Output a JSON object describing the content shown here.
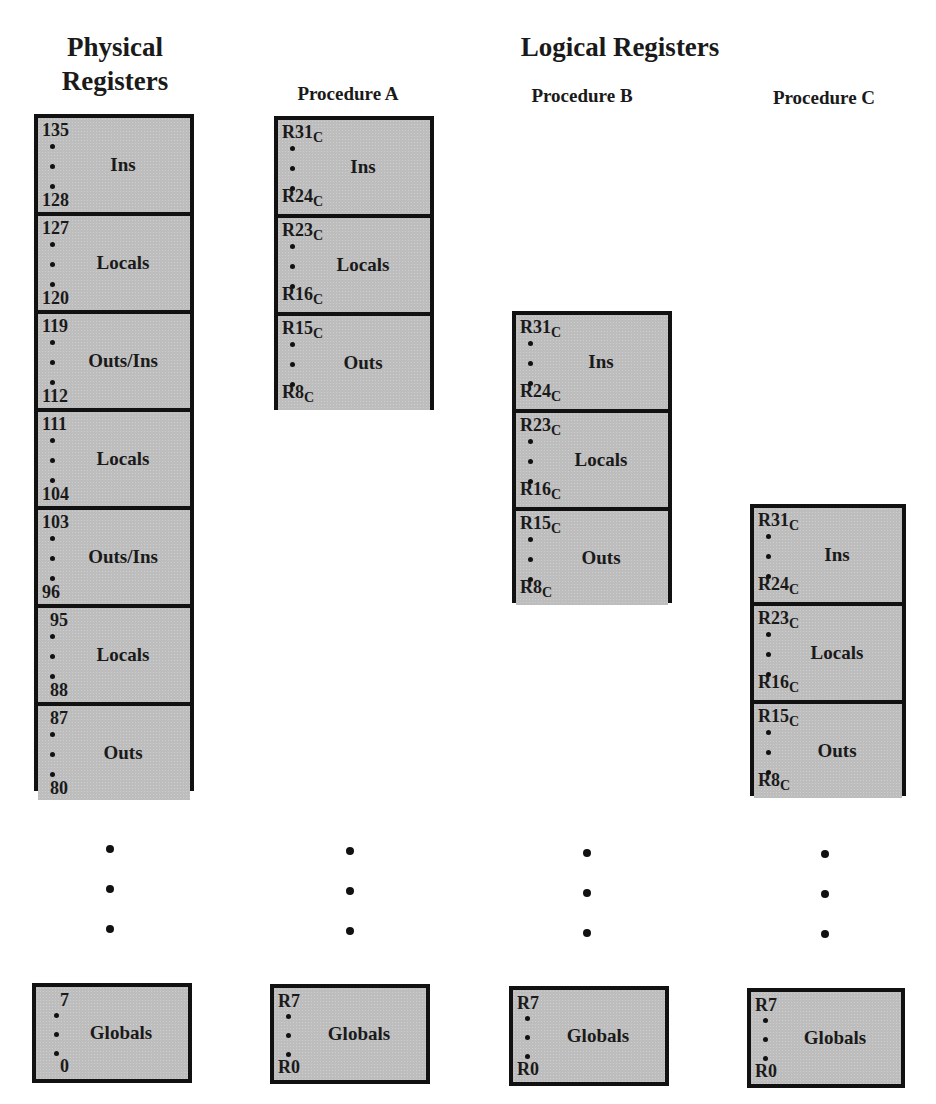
{
  "titles": {
    "physical_line1": "Physical",
    "physical_line2": "Registers",
    "logical": "Logical Registers"
  },
  "physical": {
    "windows": [
      {
        "high": "135",
        "low": "128",
        "label": "Ins"
      },
      {
        "high": "127",
        "low": "120",
        "label": "Locals"
      },
      {
        "high": "119",
        "low": "112",
        "label": "Outs/Ins"
      },
      {
        "high": "111",
        "low": "104",
        "label": "Locals"
      },
      {
        "high": "103",
        "low": "96",
        "label": "Outs/Ins"
      },
      {
        "high": "95",
        "low": "88",
        "label": "Locals"
      },
      {
        "high": "87",
        "low": "80",
        "label": "Outs"
      }
    ],
    "globals": {
      "high": "7",
      "low": "0",
      "label": "Globals"
    }
  },
  "procedures": [
    {
      "name": "Procedure A",
      "windows": [
        {
          "high": "R31",
          "high_sub": "C",
          "low": "R24",
          "low_sub": "C",
          "label": "Ins"
        },
        {
          "high": "R23",
          "high_sub": "C",
          "low": "R16",
          "low_sub": "C",
          "label": "Locals"
        },
        {
          "high": "R15",
          "high_sub": "C",
          "low": "R8",
          "low_sub": "C",
          "label": "Outs"
        }
      ],
      "globals": {
        "high": "R7",
        "low": "R0",
        "label": "Globals"
      }
    },
    {
      "name": "Procedure B",
      "windows": [
        {
          "high": "R31",
          "high_sub": "C",
          "low": "R24",
          "low_sub": "C",
          "label": "Ins"
        },
        {
          "high": "R23",
          "high_sub": "C",
          "low": "R16",
          "low_sub": "C",
          "label": "Locals"
        },
        {
          "high": "R15",
          "high_sub": "C",
          "low": "R8",
          "low_sub": "C",
          "label": "Outs"
        }
      ],
      "globals": {
        "high": "R7",
        "low": "R0",
        "label": "Globals"
      }
    },
    {
      "name": "Procedure C",
      "windows": [
        {
          "high": "R31",
          "high_sub": "C",
          "low": "R24",
          "low_sub": "C",
          "label": "Ins"
        },
        {
          "high": "R23",
          "high_sub": "C",
          "low": "R16",
          "low_sub": "C",
          "label": "Locals"
        },
        {
          "high": "R15",
          "high_sub": "C",
          "low": "R8",
          "low_sub": "C",
          "label": "Outs"
        }
      ],
      "globals": {
        "high": "R7",
        "low": "R0",
        "label": "Globals"
      }
    }
  ]
}
